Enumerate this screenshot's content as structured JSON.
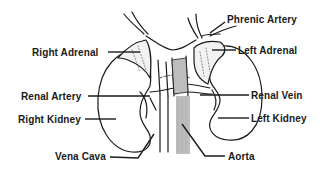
{
  "diagram": {
    "type": "anatomical-illustration",
    "colors": {
      "ink": "#1a1a1a",
      "aorta_fill": "#bdbdbd",
      "background": "#ffffff"
    },
    "labels": {
      "phrenic_artery": "Phrenic Artery",
      "right_adrenal": "Right Adrenal",
      "left_adrenal": "Left Adrenal",
      "renal_artery": "Renal Artery",
      "renal_vein": "Renal Vein",
      "right_kidney": "Right Kidney",
      "left_kidney": "Left Kidney",
      "vena_cava": "Vena Cava",
      "aorta": "Aorta"
    }
  }
}
